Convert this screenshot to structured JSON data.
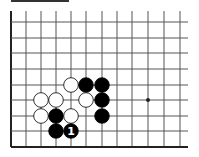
{
  "diagram": {
    "type": "go-board-partial",
    "colors": {
      "background": "#ffffff",
      "line": "#555555",
      "border": "#222222",
      "black_stone": "#000000",
      "white_stone": "#ffffff",
      "stone_outline": "#000000"
    },
    "grid": {
      "columns_x": [
        11,
        26,
        41,
        56,
        71,
        86,
        102,
        117,
        132,
        148,
        164,
        180
      ],
      "rows_y": [
        22,
        38,
        53,
        69,
        85,
        100,
        116,
        131,
        147
      ],
      "right_extent": 188,
      "top_extent": 11,
      "left_border": true,
      "bottom_border": true
    },
    "stone_radius": 7.3,
    "star_points": [
      {
        "col": 9,
        "row": 5
      }
    ],
    "stones": [
      {
        "color": "white",
        "col": 4,
        "row": 4
      },
      {
        "color": "black",
        "col": 5,
        "row": 4
      },
      {
        "color": "black",
        "col": 6,
        "row": 4
      },
      {
        "color": "white",
        "col": 2,
        "row": 5
      },
      {
        "color": "white",
        "col": 3,
        "row": 5
      },
      {
        "color": "white",
        "col": 5,
        "row": 5
      },
      {
        "color": "black",
        "col": 6,
        "row": 5
      },
      {
        "color": "white",
        "col": 2,
        "row": 6
      },
      {
        "color": "black",
        "col": 3,
        "row": 6
      },
      {
        "color": "white",
        "col": 4,
        "row": 6
      },
      {
        "color": "black",
        "col": 6,
        "row": 6
      },
      {
        "color": "black",
        "col": 3,
        "row": 7
      },
      {
        "color": "black",
        "col": 4,
        "row": 7,
        "label": "1"
      }
    ]
  }
}
